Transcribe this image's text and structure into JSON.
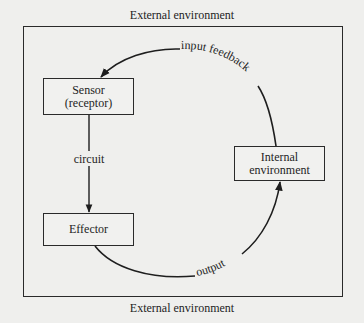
{
  "diagram": {
    "top_label": "External environment",
    "bottom_label": "External environment",
    "nodes": {
      "sensor": {
        "line1": "Sensor",
        "line2": "(receptor)"
      },
      "effector": {
        "label": "Effector"
      },
      "internal": {
        "line1": "Internal",
        "line2": "environment"
      }
    },
    "edges": {
      "circuit": "circuit",
      "input_feedback": "input feedback",
      "output": "output"
    },
    "colors": {
      "background": "#efefed",
      "line": "#1e1e1e"
    }
  }
}
